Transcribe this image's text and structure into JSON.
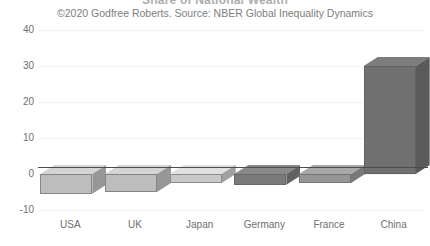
{
  "chart_data": {
    "type": "bar",
    "title": "Share of National Wealth",
    "subtitle": "©2020 Godfree Roberts. Source: NBER Global Inequality Dynamics",
    "categories": [
      "USA",
      "UK",
      "Japan",
      "Germany",
      "France",
      "China"
    ],
    "values": [
      -5.5,
      -5,
      -2.5,
      -3,
      -2.5,
      30
    ],
    "series": [
      {
        "name": "Change",
        "values": [
          -5.5,
          -5,
          -2.5,
          -3,
          -2.5,
          30
        ]
      }
    ],
    "xlabel": "",
    "ylabel": "",
    "ylim": [
      -10,
      40
    ],
    "ytick_labels": [
      "40",
      "30",
      "20",
      "10",
      "0",
      "-10"
    ],
    "ytick_values": [
      40,
      30,
      20,
      10,
      0,
      -10
    ],
    "grid": true,
    "legend": "none",
    "style": "3d-bar",
    "bar_colors": [
      "#bdbdbd",
      "#bdbdbd",
      "#c9c9c9",
      "#7a7a7a",
      "#969696",
      "#707070"
    ]
  },
  "axis": {
    "y_labels": [
      "40",
      "30",
      "20",
      "10",
      "0",
      "-10"
    ],
    "x_labels": [
      "USA",
      "UK",
      "Japan",
      "Germany",
      "France",
      "China"
    ]
  },
  "header": {
    "title": "Share of National Wealth",
    "subtitle": "©2020 Godfree Roberts. Source: NBER Global Inequality Dynamics"
  }
}
